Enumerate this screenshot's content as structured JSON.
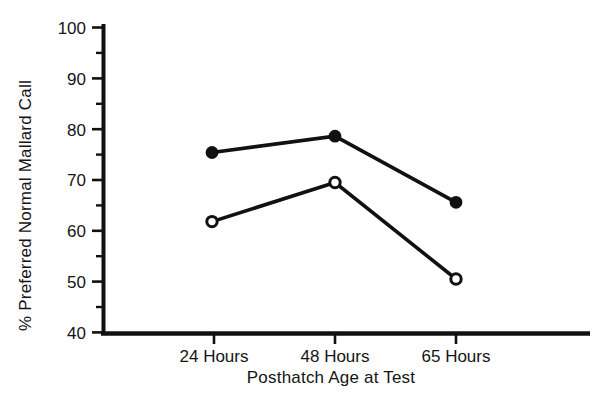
{
  "chart_data": {
    "type": "line",
    "title": "",
    "subtitle": "",
    "xlabel": "Posthatch Age at Test",
    "ylabel": "% Preferred Normal Mallard Call",
    "categories": [
      "24 Hours",
      "48 Hours",
      "65 Hours"
    ],
    "ylim": [
      40,
      100
    ],
    "ytick_labels": [
      "100",
      "90",
      "80",
      "70",
      "60",
      "50",
      "40"
    ],
    "ytick_values": [
      100,
      90,
      80,
      70,
      60,
      50,
      40
    ],
    "yminor_tick_values": [
      95,
      85,
      75,
      65,
      55,
      45
    ],
    "grid": false,
    "legend": "none",
    "series": [
      {
        "name": "filled-circle-series",
        "marker": "filled-circle",
        "color": "#111111",
        "values": [
          75.4,
          78.6,
          65.6
        ]
      },
      {
        "name": "open-circle-series",
        "marker": "open-circle",
        "color": "#111111",
        "values": [
          61.8,
          69.5,
          50.5
        ]
      }
    ],
    "annotations": []
  },
  "axes": {
    "y_axis_name": "y-axis",
    "x_axis_name": "x-axis"
  }
}
